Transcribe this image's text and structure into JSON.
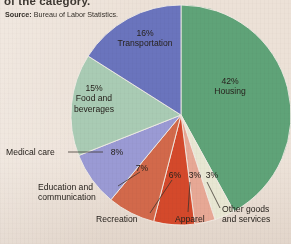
{
  "figure": {
    "caption_cut_top": "of the category.",
    "source_label": "Source:",
    "source_text": "Bureau of Labor Statistics."
  },
  "chart_data": {
    "type": "pie",
    "title": "",
    "xlabel": "",
    "ylabel": "",
    "legend_position": "none",
    "grid": false,
    "units": "percent",
    "categories": [
      "Housing",
      "Other goods and services",
      "Apparel",
      "Recreation",
      "Education and communication",
      "Medical care",
      "Food and beverages",
      "Transportation"
    ],
    "values": [
      42,
      3,
      3,
      6,
      7,
      8,
      15,
      16
    ],
    "value_labels": [
      "42%",
      "3%",
      "3%",
      "6%",
      "7%",
      "8%",
      "15%",
      "16%"
    ],
    "colors": [
      "#5fa378",
      "#e8e7d3",
      "#e7a895",
      "#d4492b",
      "#d2694b",
      "#9a9ad4",
      "#a9cbb4",
      "#6a74bd"
    ],
    "slices": [
      {
        "label": "Housing",
        "value": 42,
        "value_label": "42%",
        "color": "#5fa378"
      },
      {
        "label": "Other goods and services",
        "value": 3,
        "value_label": "3%",
        "color": "#e8e7d3"
      },
      {
        "label": "Apparel",
        "value": 3,
        "value_label": "3%",
        "color": "#e7a895"
      },
      {
        "label": "Recreation",
        "value": 6,
        "value_label": "6%",
        "color": "#d4492b"
      },
      {
        "label": "Education and communication",
        "value": 7,
        "value_label": "7%",
        "color": "#d2694b"
      },
      {
        "label": "Medical care",
        "value": 8,
        "value_label": "8%",
        "color": "#9a9ad4"
      },
      {
        "label": "Food and beverages",
        "value": 15,
        "value_label": "15%",
        "color": "#a9cbb4"
      },
      {
        "label": "Transportation",
        "value": 16,
        "value_label": "16%",
        "color": "#6a74bd"
      }
    ],
    "labels_text": {
      "housing_pct": "42%",
      "housing_name": "Housing",
      "transportation_pct": "16%",
      "transportation_name": "Transportation",
      "food_pct": "15%",
      "food_name_line1": "Food and",
      "food_name_line2": "beverages",
      "medical_name": "Medical care",
      "medical_pct": "8%",
      "education_name_line1": "Education and",
      "education_name_line2": "communication",
      "education_pct": "7%",
      "recreation_name": "Recreation",
      "recreation_pct": "6%",
      "apparel_name": "Apparel",
      "apparel_pct": "3%",
      "other_name_line1": "Other goods",
      "other_name_line2": "and services",
      "other_pct": "3%"
    }
  }
}
